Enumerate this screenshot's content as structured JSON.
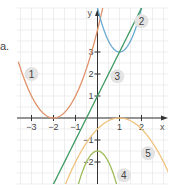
{
  "side_label": "a.",
  "chart_data": {
    "type": "line",
    "title": "",
    "xlabel": "x",
    "ylabel": "y",
    "xlim": [
      -3.5,
      3.2
    ],
    "ylim": [
      -3.0,
      4.7
    ],
    "x_ticks": [
      "−3",
      "−2",
      "−1",
      "1",
      "2"
    ],
    "y_ticks": [
      "−2",
      "−1",
      "1",
      "2",
      "3"
    ],
    "grid": true,
    "series": [
      {
        "name": "1",
        "label_pos": [
          -3.0,
          2.0
        ],
        "color": "#e0926a",
        "equation": "y = (x+2)^2",
        "vertex": [
          -2,
          0
        ]
      },
      {
        "name": "2",
        "label_pos": [
          2.0,
          4.4
        ],
        "color": "#6aa9d0",
        "equation": "y = 2(x-1)^2 + 3",
        "vertex": [
          1,
          3
        ]
      },
      {
        "name": "3",
        "label_pos": [
          0.9,
          1.9
        ],
        "color": "#3f9a63",
        "equation": "y = 2x + 1",
        "points": [
          [
            0,
            1
          ],
          [
            1,
            3
          ]
        ]
      },
      {
        "name": "4",
        "label_pos": [
          1.2,
          -2.6
        ],
        "color": "#9dbb5a",
        "equation": "y = -2x^2 - 1.5",
        "vertex": [
          0,
          -1.5
        ]
      },
      {
        "name": "5",
        "label_pos": [
          2.3,
          -1.6
        ],
        "color": "#f0c27e",
        "equation": "y = -0.5(x-1)^2",
        "vertex": [
          1,
          0
        ]
      }
    ]
  }
}
